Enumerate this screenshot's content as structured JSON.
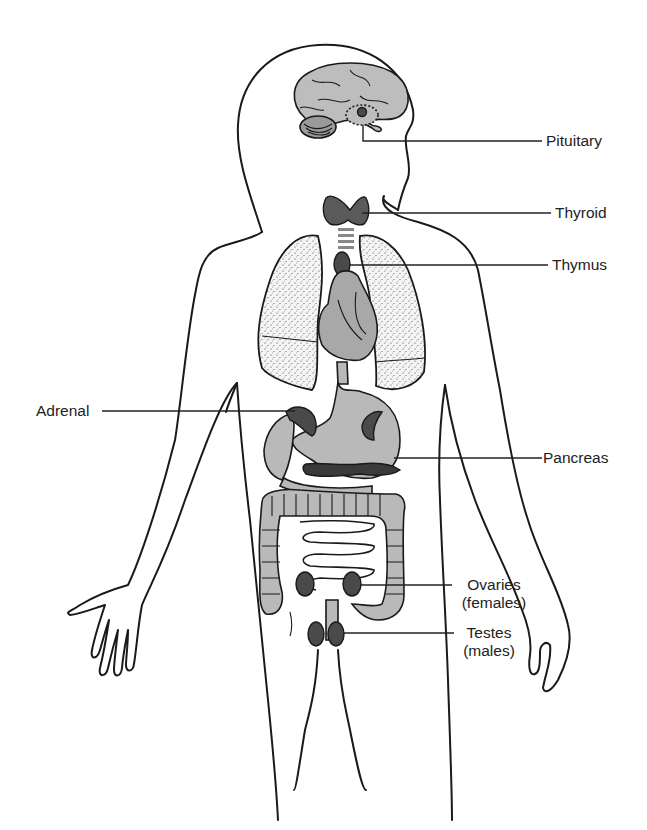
{
  "figure": {
    "labels": {
      "pituitary": "Pituitary",
      "thyroid": "Thyroid",
      "thymus": "Thymus",
      "adrenal": "Adrenal",
      "pancreas": "Pancreas",
      "ovaries": "Ovaries",
      "ovaries_note": "(females)",
      "testes": "Testes",
      "testes_note": "(males)"
    }
  }
}
